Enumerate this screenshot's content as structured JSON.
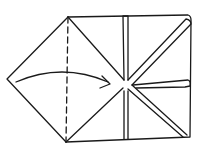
{
  "diagram": {
    "type": "origami-fold-step",
    "stroke_color": "#1a1a1a",
    "background": "#ffffff",
    "elements": [
      {
        "name": "left-flap",
        "kind": "triangle"
      },
      {
        "name": "valley-fold-line",
        "kind": "dashed-line"
      },
      {
        "name": "fold-arrow",
        "kind": "curved-arrow"
      },
      {
        "name": "square-body",
        "kind": "square"
      },
      {
        "name": "vertical-pleat",
        "kind": "double-line"
      },
      {
        "name": "diagonal-pleat-upper",
        "kind": "double-line"
      },
      {
        "name": "diagonal-pleat-lower",
        "kind": "double-line"
      },
      {
        "name": "horizontal-pleat-right",
        "kind": "double-line"
      }
    ]
  }
}
